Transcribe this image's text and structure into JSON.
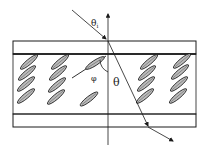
{
  "diagram": {
    "type": "liquid-crystal-cell-refraction",
    "labels": {
      "incident_angle": "θ",
      "incident_angle_sub": "i",
      "refraction_angle": "θ",
      "tilt_angle": "φ"
    },
    "colors": {
      "line": "#1a1a1a",
      "molecule_fill": "#bdbdbd",
      "background": "#ffffff"
    },
    "molecules": {
      "columns": [
        {
          "x": 25,
          "count": 4
        },
        {
          "x": 56,
          "count": 4
        },
        {
          "x": 144,
          "count": 4
        },
        {
          "x": 177,
          "count": 4
        }
      ],
      "center_single": {
        "x": 86,
        "y": 101
      },
      "highlighted": {
        "x": 92,
        "y": 62
      }
    }
  }
}
